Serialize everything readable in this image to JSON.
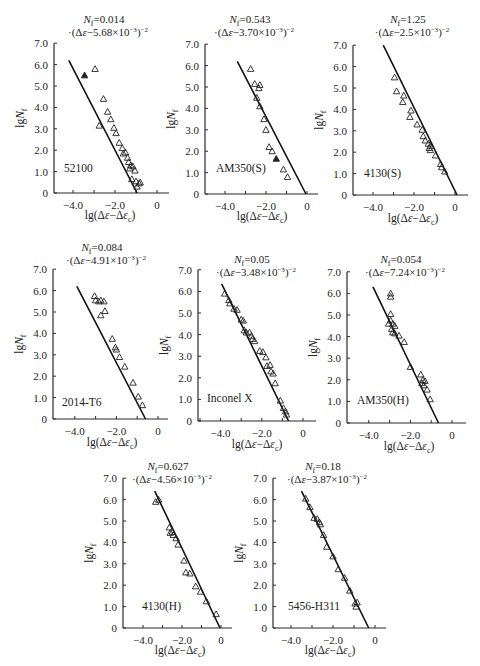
{
  "figure": {
    "panel_count": 8
  },
  "chart_data": [
    {
      "type": "scatter",
      "material": "52100",
      "equation_line1": "Nf=0.014",
      "equation_line2": "·(Δε−5.68×10⁻³)⁻²",
      "xlabel": "lg(Δε−Δεc)",
      "ylabel": "lgNf",
      "xticks": [
        -4.0,
        -2.0,
        0
      ],
      "xtick_labels": [
        "−4.0",
        "−2.0",
        "0"
      ],
      "yticks": [
        0,
        1,
        2,
        3,
        4,
        5,
        6,
        7
      ],
      "ytick_labels": [
        "0",
        "1.0",
        "2.0",
        "3.0",
        "4.0",
        "5.0",
        "6.0",
        "7.0"
      ],
      "xlim": [
        -5.0,
        0.8
      ],
      "ylim": [
        0,
        7.0
      ],
      "fit_line": [
        [
          -4.2,
          6.2
        ],
        [
          -0.95,
          0
        ]
      ],
      "points": [
        [
          -3.45,
          5.5,
          "filled"
        ],
        [
          -2.95,
          5.8
        ],
        [
          -2.55,
          4.4
        ],
        [
          -2.35,
          3.8
        ],
        [
          -2.2,
          3.45
        ],
        [
          -2.05,
          3.05
        ],
        [
          -1.95,
          2.8
        ],
        [
          -2.75,
          3.15
        ],
        [
          -1.8,
          2.35
        ],
        [
          -1.65,
          2.1
        ],
        [
          -1.6,
          1.85
        ],
        [
          -1.5,
          1.9
        ],
        [
          -1.4,
          1.65
        ],
        [
          -1.35,
          1.45
        ],
        [
          -1.25,
          1.3
        ],
        [
          -1.15,
          1.25
        ],
        [
          -1.3,
          1.15
        ],
        [
          -1.05,
          1.05
        ],
        [
          -1.2,
          0.65
        ],
        [
          -1.0,
          0.55
        ],
        [
          -0.85,
          0.45
        ],
        [
          -0.95,
          0.3
        ],
        [
          -0.8,
          0.5
        ]
      ]
    },
    {
      "type": "scatter",
      "material": "AM350(S)",
      "equation_line1": "Nf=0.543",
      "equation_line2": "·(Δε−3.70×10⁻³)⁻²",
      "xlabel": "lg(Δε−Δεc)",
      "ylabel": "lgNf",
      "xticks": [
        -4.0,
        -2.0,
        0
      ],
      "xtick_labels": [
        "−4.0",
        "−2.0",
        "0"
      ],
      "yticks": [
        0,
        1,
        2,
        3,
        4,
        5,
        6,
        7
      ],
      "ytick_labels": [
        "0",
        "1.0",
        "2.0",
        "3.0",
        "4.0",
        "5.0",
        "6.0",
        "7.0"
      ],
      "xlim": [
        -5.0,
        0.6
      ],
      "ylim": [
        0,
        7.0
      ],
      "fit_line": [
        [
          -3.4,
          6.2
        ],
        [
          -0.05,
          0
        ]
      ],
      "points": [
        [
          -2.75,
          5.85
        ],
        [
          -2.55,
          5.15
        ],
        [
          -2.3,
          5.1
        ],
        [
          -2.35,
          4.95
        ],
        [
          -2.45,
          4.5
        ],
        [
          -2.3,
          4.1
        ],
        [
          -2.1,
          3.5
        ],
        [
          -2.0,
          3.0
        ],
        [
          -1.85,
          2.2
        ],
        [
          -1.7,
          2.0
        ],
        [
          -1.5,
          1.65,
          "filled"
        ],
        [
          -1.15,
          1.15
        ],
        [
          -0.95,
          0.8
        ]
      ]
    },
    {
      "type": "scatter",
      "material": "4130(S)",
      "equation_line1": "Nf=1.25",
      "equation_line2": "·(Δε−2.5×10⁻³)⁻²",
      "xlabel": "lg(Δε−Δεc)",
      "ylabel": "lgNf",
      "xticks": [
        -4.0,
        -2.0,
        0
      ],
      "xtick_labels": [
        "−4.0",
        "−2.0",
        "0"
      ],
      "yticks": [
        0,
        1,
        2,
        3,
        4,
        5,
        6,
        7
      ],
      "ytick_labels": [
        "0",
        "1.0",
        "2.0",
        "3.0",
        "4.0",
        "5.0",
        "6.0",
        "7.0"
      ],
      "xlim": [
        -5.0,
        0.6
      ],
      "ylim": [
        0,
        7.0
      ],
      "fit_line": [
        [
          -3.5,
          7.0
        ],
        [
          0.1,
          0
        ]
      ],
      "points": [
        [
          -2.95,
          5.5
        ],
        [
          -2.85,
          4.85
        ],
        [
          -2.5,
          4.65
        ],
        [
          -2.55,
          4.35
        ],
        [
          -2.15,
          3.95
        ],
        [
          -2.2,
          3.65
        ],
        [
          -1.85,
          3.3
        ],
        [
          -1.6,
          3.05
        ],
        [
          -1.55,
          2.75
        ],
        [
          -1.45,
          2.55
        ],
        [
          -1.3,
          2.4
        ],
        [
          -1.2,
          2.3
        ],
        [
          -1.25,
          2.2
        ],
        [
          -1.2,
          2.1
        ],
        [
          -0.95,
          1.85
        ],
        [
          -0.7,
          1.45
        ],
        [
          -0.65,
          1.3
        ],
        [
          -0.5,
          1.1
        ]
      ]
    },
    {
      "type": "scatter",
      "material": "2014-T6",
      "equation_line1": "Nf=0.084",
      "equation_line2": "·(Δε−4.91×10⁻³)⁻²",
      "xlabel": "lg(Δε−Δεc)",
      "ylabel": "lgNf",
      "xticks": [
        -4.0,
        -2.0,
        0
      ],
      "xtick_labels": [
        "−4.0",
        "−2.0",
        "0"
      ],
      "yticks": [
        0,
        1,
        2,
        3,
        4,
        5,
        6,
        7
      ],
      "ytick_labels": [
        "0",
        "1.0",
        "2.0",
        "3.0",
        "4.0",
        "5.0",
        "6.0",
        "7.0"
      ],
      "xlim": [
        -5.0,
        0.8
      ],
      "ylim": [
        0,
        7.0
      ],
      "fit_line": [
        [
          -3.9,
          6.2
        ],
        [
          -0.6,
          0
        ]
      ],
      "points": [
        [
          -3.05,
          5.75
        ],
        [
          -3.0,
          5.55
        ],
        [
          -2.85,
          5.5
        ],
        [
          -2.75,
          5.55
        ],
        [
          -2.6,
          5.5
        ],
        [
          -2.75,
          4.85
        ],
        [
          -2.55,
          5.05
        ],
        [
          -2.2,
          3.75
        ],
        [
          -2.05,
          3.35
        ],
        [
          -2.0,
          3.25
        ],
        [
          -1.85,
          2.9
        ],
        [
          -1.6,
          2.45
        ],
        [
          -1.2,
          1.7
        ],
        [
          -0.95,
          1.05
        ],
        [
          -0.75,
          0.65
        ]
      ]
    },
    {
      "type": "scatter",
      "material": "Inconel X",
      "equation_line1": "Nf=0.05",
      "equation_line2": "·(Δε−3.48×10⁻³)⁻²",
      "xlabel": "lg(Δε−Δεc)",
      "ylabel": "lgNf",
      "xticks": [
        -4.0,
        -2.0,
        0
      ],
      "xtick_labels": [
        "−4.0",
        "−2.0",
        "0"
      ],
      "yticks": [
        0,
        1,
        2,
        3,
        4,
        5,
        6,
        7
      ],
      "ytick_labels": [
        "0",
        "1.0",
        "2.0",
        "3.0",
        "4.0",
        "5.0",
        "6.0",
        "7.0"
      ],
      "xlim": [
        -5.0,
        0.8
      ],
      "ylim": [
        0,
        7.0
      ],
      "fit_line": [
        [
          -3.95,
          6.35
        ],
        [
          -0.7,
          0
        ]
      ],
      "points": [
        [
          -3.8,
          5.9
        ],
        [
          -3.6,
          5.6
        ],
        [
          -3.55,
          5.45
        ],
        [
          -3.35,
          5.2
        ],
        [
          -3.2,
          5.15
        ],
        [
          -3.0,
          4.7
        ],
        [
          -2.9,
          4.65
        ],
        [
          -2.85,
          4.2
        ],
        [
          -2.75,
          4.1
        ],
        [
          -2.6,
          4.1
        ],
        [
          -2.5,
          3.95
        ],
        [
          -2.45,
          3.8
        ],
        [
          -2.35,
          3.7
        ],
        [
          -2.1,
          3.25
        ],
        [
          -1.95,
          3.2
        ],
        [
          -1.8,
          2.95
        ],
        [
          -1.75,
          2.55
        ],
        [
          -1.6,
          2.6
        ],
        [
          -1.55,
          2.3
        ],
        [
          -1.45,
          2.2
        ],
        [
          -1.35,
          1.75
        ],
        [
          -1.1,
          0.95
        ],
        [
          -0.95,
          0.6
        ],
        [
          -0.85,
          0.45
        ],
        [
          -0.8,
          0.3
        ]
      ]
    },
    {
      "type": "scatter",
      "material": "AM350(H)",
      "equation_line1": "Nf=0.054",
      "equation_line2": "·(Δε−7.24×10⁻³)⁻²",
      "xlabel": "lg(Δε−Δεc)",
      "ylabel": "lgNf",
      "xticks": [
        -4.0,
        -2.0,
        0
      ],
      "xtick_labels": [
        "−4.0",
        "−2.0",
        "0"
      ],
      "yticks": [
        0,
        1,
        2,
        3,
        4,
        5,
        6,
        7
      ],
      "ytick_labels": [
        "0",
        "1.0",
        "2.0",
        "3.0",
        "4.0",
        "5.0",
        "6.0",
        "7.0"
      ],
      "xlim": [
        -5.0,
        0.9
      ],
      "ylim": [
        0,
        7.0
      ],
      "fit_line": [
        [
          -3.8,
          6.3
        ],
        [
          -0.65,
          0
        ]
      ],
      "points": [
        [
          -2.95,
          6.0
        ],
        [
          -2.95,
          5.85
        ],
        [
          -2.95,
          5.05
        ],
        [
          -2.95,
          4.75
        ],
        [
          -3.05,
          4.6
        ],
        [
          -2.85,
          4.6
        ],
        [
          -2.75,
          4.5
        ],
        [
          -2.9,
          4.35
        ],
        [
          -2.85,
          4.2
        ],
        [
          -2.75,
          4.15
        ],
        [
          -2.55,
          4.05
        ],
        [
          -2.3,
          3.75
        ],
        [
          -2.0,
          2.6
        ],
        [
          -1.5,
          2.25
        ],
        [
          -1.4,
          2.0
        ],
        [
          -1.3,
          1.95
        ],
        [
          -1.45,
          1.85
        ],
        [
          -1.35,
          1.75
        ],
        [
          -1.2,
          1.55
        ],
        [
          -1.05,
          1.1
        ]
      ]
    },
    {
      "type": "scatter",
      "material": "4130(H)",
      "equation_line1": "Nf=0.627",
      "equation_line2": "·(Δε−4.56×10⁻³)⁻²",
      "xlabel": "lg(Δε−Δεc)",
      "ylabel": "lgNf",
      "xticks": [
        -4.0,
        -2.0,
        0
      ],
      "xtick_labels": [
        "−4.0",
        "−2.0",
        "0"
      ],
      "yticks": [
        0,
        1,
        2,
        3,
        4,
        5,
        6,
        7
      ],
      "ytick_labels": [
        "0",
        "1.0",
        "2.0",
        "3.0",
        "4.0",
        "5.0",
        "6.0",
        "7.0"
      ],
      "xlim": [
        -5.0,
        0.8
      ],
      "ylim": [
        0,
        7.0
      ],
      "fit_line": [
        [
          -3.4,
          6.4
        ],
        [
          -0.05,
          0
        ]
      ],
      "points": [
        [
          -3.35,
          5.9
        ],
        [
          -3.2,
          6.0
        ],
        [
          -2.65,
          4.7
        ],
        [
          -2.6,
          4.45
        ],
        [
          -2.5,
          4.5
        ],
        [
          -2.45,
          4.35
        ],
        [
          -2.3,
          4.2
        ],
        [
          -2.2,
          3.9
        ],
        [
          -1.9,
          3.15
        ],
        [
          -1.8,
          2.6
        ],
        [
          -1.6,
          2.55
        ],
        [
          -1.3,
          1.95
        ],
        [
          -1.05,
          1.7
        ],
        [
          -0.75,
          1.25
        ],
        [
          -0.25,
          0.65
        ]
      ]
    },
    {
      "type": "scatter",
      "material": "5456-H311",
      "equation_line1": "Nf=0.18",
      "equation_line2": "·(Δε−3.87×10⁻³)⁻²",
      "xlabel": "lg(Δε−Δεc)",
      "ylabel": "lgNf",
      "xticks": [
        -4.0,
        -2.0,
        0
      ],
      "xtick_labels": [
        "−4.0",
        "−2.0",
        "0"
      ],
      "yticks": [
        0,
        1,
        2,
        3,
        4,
        5,
        6,
        7
      ],
      "ytick_labels": [
        "0",
        "1.0",
        "2.0",
        "3.0",
        "4.0",
        "5.0",
        "6.0",
        "7.0"
      ],
      "xlim": [
        -5.0,
        0.6
      ],
      "ylim": [
        0,
        7.0
      ],
      "fit_line": [
        [
          -3.5,
          6.4
        ],
        [
          -0.3,
          0
        ]
      ],
      "points": [
        [
          -3.3,
          6.05
        ],
        [
          -3.1,
          5.65
        ],
        [
          -2.9,
          5.15
        ],
        [
          -2.75,
          5.1
        ],
        [
          -2.65,
          4.95
        ],
        [
          -2.6,
          4.85
        ],
        [
          -2.45,
          4.35
        ],
        [
          -2.3,
          3.8
        ],
        [
          -2.0,
          3.35
        ],
        [
          -1.75,
          2.75
        ],
        [
          -1.45,
          2.35
        ],
        [
          -1.2,
          1.75
        ],
        [
          -0.95,
          1.15
        ],
        [
          -0.9,
          1.0
        ],
        [
          -0.85,
          1.2
        ]
      ]
    }
  ],
  "layout": [
    {
      "ox": 54,
      "oy": 193,
      "x0px": 157,
      "xunit": 21.0,
      "yunit": 21.4,
      "xmin_px": 54,
      "xmax_px": 169,
      "eq_x": 104,
      "eq_y": 23,
      "mat_x": 64,
      "mat_y": 172,
      "xl_x": 110,
      "xl_y": 219
    },
    {
      "ox": 205,
      "oy": 194,
      "x0px": 307,
      "xunit": 20.5,
      "yunit": 21.4,
      "xmin_px": 205,
      "xmax_px": 318,
      "eq_x": 250,
      "eq_y": 23,
      "mat_x": 216,
      "mat_y": 172,
      "xl_x": 262,
      "xl_y": 220
    },
    {
      "ox": 353,
      "oy": 195,
      "x0px": 455,
      "xunit": 20.5,
      "yunit": 21.4,
      "xmin_px": 353,
      "xmax_px": 468,
      "eq_x": 408,
      "eq_y": 23,
      "mat_x": 364,
      "mat_y": 177,
      "xl_x": 413,
      "xl_y": 222
    },
    {
      "ox": 53,
      "oy": 419,
      "x0px": 158,
      "xunit": 20.8,
      "yunit": 21.4,
      "xmin_px": 53,
      "xmax_px": 168,
      "eq_x": 102,
      "eq_y": 251,
      "mat_x": 62,
      "mat_y": 406,
      "xl_x": 112,
      "xl_y": 446
    },
    {
      "ox": 198,
      "oy": 421,
      "x0px": 303,
      "xunit": 20.6,
      "yunit": 21.6,
      "xmin_px": 198,
      "xmax_px": 316,
      "eq_x": 252,
      "eq_y": 263,
      "mat_x": 207,
      "mat_y": 402,
      "xl_x": 257,
      "xl_y": 448
    },
    {
      "ox": 347,
      "oy": 423,
      "x0px": 452,
      "xunit": 20.8,
      "yunit": 21.6,
      "xmin_px": 347,
      "xmax_px": 466,
      "eq_x": 401,
      "eq_y": 263,
      "mat_x": 357,
      "mat_y": 404,
      "xl_x": 409,
      "xl_y": 450
    },
    {
      "ox": 123,
      "oy": 628,
      "x0px": 221,
      "xunit": 19.5,
      "yunit": 21.4,
      "xmin_px": 123,
      "xmax_px": 232,
      "eq_x": 168,
      "eq_y": 470,
      "mat_x": 142,
      "mat_y": 610,
      "xl_x": 180,
      "xl_y": 654
    },
    {
      "ox": 273,
      "oy": 628,
      "x0px": 375,
      "xunit": 21.0,
      "yunit": 21.4,
      "xmin_px": 273,
      "xmax_px": 386,
      "eq_x": 323,
      "eq_y": 470,
      "mat_x": 288,
      "mat_y": 610,
      "xl_x": 330,
      "xl_y": 654
    }
  ]
}
